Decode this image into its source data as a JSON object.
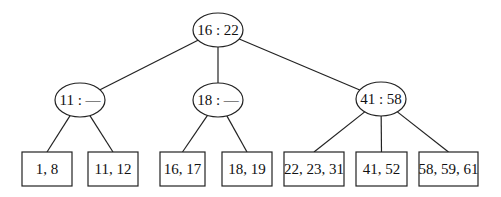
{
  "diagram": {
    "type": "2-3 tree / B-tree",
    "root": {
      "label": "16 : 22",
      "cx": 218,
      "cy": 30,
      "rx": 25,
      "ry": 17
    },
    "internal": [
      {
        "label": "11 : —",
        "cx": 80,
        "cy": 100,
        "rx": 25,
        "ry": 17
      },
      {
        "label": "18 : —",
        "cx": 218,
        "cy": 100,
        "rx": 25,
        "ry": 17
      },
      {
        "label": "41 : 58",
        "cx": 381,
        "cy": 99,
        "rx": 25,
        "ry": 17
      }
    ],
    "leaves": [
      {
        "label": "1, 8",
        "x": 22,
        "y": 152,
        "w": 50,
        "h": 34,
        "parent": 0
      },
      {
        "label": "11, 12",
        "x": 88,
        "y": 152,
        "w": 50,
        "h": 34,
        "parent": 0
      },
      {
        "label": "16, 17",
        "x": 160,
        "y": 152,
        "w": 45,
        "h": 34,
        "parent": 1
      },
      {
        "label": "18, 19",
        "x": 222,
        "y": 152,
        "w": 50,
        "h": 34,
        "parent": 1
      },
      {
        "label": "22, 23, 31",
        "x": 284,
        "y": 152,
        "w": 60,
        "h": 34,
        "parent": 2
      },
      {
        "label": "41, 52",
        "x": 356,
        "y": 152,
        "w": 51,
        "h": 34,
        "parent": 2
      },
      {
        "label": "58, 59, 61",
        "x": 419,
        "y": 152,
        "w": 59,
        "h": 34,
        "parent": 2
      }
    ],
    "colors": {
      "stroke": "#222222",
      "fill": "#ffffff",
      "text": "#111111"
    }
  }
}
